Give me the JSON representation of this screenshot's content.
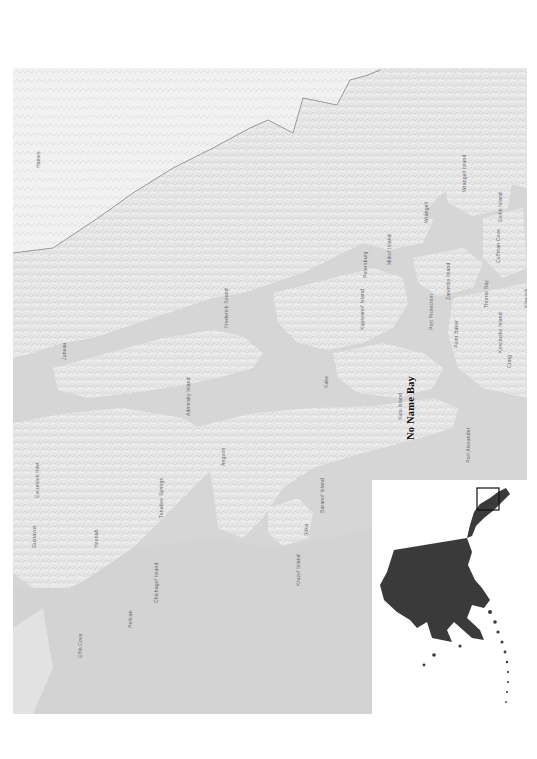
{
  "figure": {
    "orientation": "rotated -90deg",
    "colors": {
      "page_background": "#ffffff",
      "water": "#d6d6d6",
      "land_light": "#efefef",
      "land_relief": "#e2e2e2",
      "border_line": "#9a9a9a",
      "label_text": "#6a6a6a",
      "feature_label": "#111111",
      "inset_land": "#3a3a3a",
      "inset_frame": "#111111"
    }
  },
  "main_map": {
    "highlight_label": "No Name Bay",
    "labels": [
      {
        "id": "juneau",
        "text": "Juneau",
        "x": 48,
        "y": 292
      },
      {
        "id": "admiralty",
        "text": "Admiralty Island",
        "x": 172,
        "y": 348
      },
      {
        "id": "angoon",
        "text": "Angoon",
        "x": 207,
        "y": 398
      },
      {
        "id": "tenakee",
        "text": "Tenakee Springs",
        "x": 145,
        "y": 450
      },
      {
        "id": "hoonah",
        "text": "Hoonah",
        "x": 80,
        "y": 480
      },
      {
        "id": "gustavus",
        "text": "Gustavus",
        "x": 18,
        "y": 480
      },
      {
        "id": "excursion",
        "text": "Excursion Inlet",
        "x": 21,
        "y": 430
      },
      {
        "id": "chichagof",
        "text": "Chichagof Island",
        "x": 140,
        "y": 535
      },
      {
        "id": "pelican",
        "text": "Pelican",
        "x": 114,
        "y": 560
      },
      {
        "id": "elfin",
        "text": "Elfin Cove",
        "x": 64,
        "y": 590
      },
      {
        "id": "sitka",
        "text": "Sitka",
        "x": 290,
        "y": 468
      },
      {
        "id": "kruzof",
        "text": "Kruzof Island",
        "x": 282,
        "y": 518
      },
      {
        "id": "baranof",
        "text": "Baranof Island",
        "x": 306,
        "y": 445
      },
      {
        "id": "port_alex",
        "text": "Port Alexander",
        "x": 452,
        "y": 395
      },
      {
        "id": "kake",
        "text": "Kake",
        "x": 310,
        "y": 320
      },
      {
        "id": "frederick",
        "text": "Frederick Sound",
        "x": 210,
        "y": 260
      },
      {
        "id": "kuiu",
        "text": "Kuiu Island",
        "x": 384,
        "y": 352
      },
      {
        "id": "kupreanof",
        "text": "Kupreanof Island",
        "x": 346,
        "y": 262
      },
      {
        "id": "petersburg",
        "text": "Petersburg",
        "x": 349,
        "y": 210
      },
      {
        "id": "mitkof",
        "text": "Mitkof Island",
        "x": 373,
        "y": 197
      },
      {
        "id": "wrangell",
        "text": "Wrangell",
        "x": 410,
        "y": 155
      },
      {
        "id": "zarembo",
        "text": "Zarembo Island",
        "x": 432,
        "y": 232
      },
      {
        "id": "wrangell_island",
        "text": "Wrangell Island",
        "x": 448,
        "y": 124
      },
      {
        "id": "etolin",
        "text": "Etolin Island",
        "x": 484,
        "y": 154
      },
      {
        "id": "point_baker",
        "text": "Point Baker",
        "x": 440,
        "y": 280
      },
      {
        "id": "port_protection",
        "text": "Port Protection",
        "x": 415,
        "y": 262
      },
      {
        "id": "thorne_bay",
        "text": "Thorne Bay",
        "x": 470,
        "y": 240
      },
      {
        "id": "coffman",
        "text": "Coffman Cove",
        "x": 482,
        "y": 195
      },
      {
        "id": "kosciusko",
        "text": "Kosciusko Island",
        "x": 484,
        "y": 285
      },
      {
        "id": "klawock",
        "text": "Klawock",
        "x": 510,
        "y": 240
      },
      {
        "id": "craig",
        "text": "Craig",
        "x": 493,
        "y": 300
      },
      {
        "id": "haines",
        "text": "Haines",
        "x": 22,
        "y": 100
      }
    ],
    "feature_label_position": {
      "x": 392,
      "y": 372
    }
  },
  "inset_map": {
    "region": "Alaska",
    "locator_box": "Southeast Alaska study area"
  }
}
